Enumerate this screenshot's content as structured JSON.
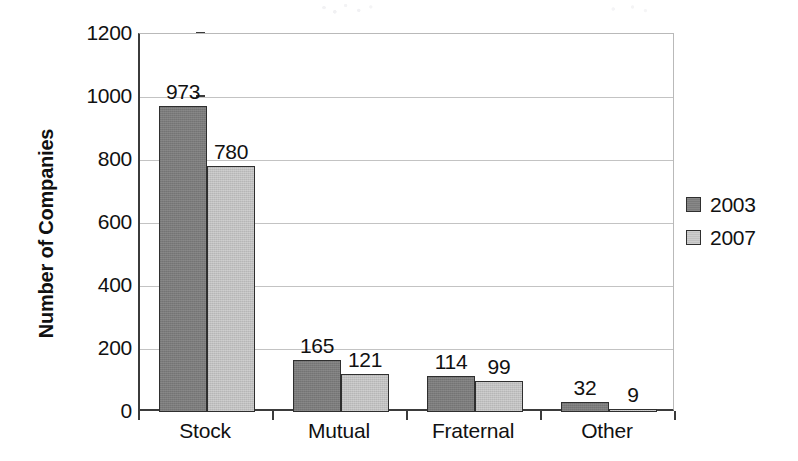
{
  "chart_data": {
    "type": "bar",
    "title": "",
    "xlabel": "",
    "ylabel": "Number of Companies",
    "categories": [
      "Stock",
      "Mutual",
      "Fraternal",
      "Other"
    ],
    "series": [
      {
        "name": "2003",
        "color": "#7b7b7b",
        "values": [
          973,
          165,
          114,
          32
        ]
      },
      {
        "name": "2007",
        "color": "#c0c0c0",
        "values": [
          780,
          121,
          99,
          9
        ]
      }
    ],
    "ylim": [
      0,
      1200
    ],
    "ytick_labels": [
      "0",
      "200",
      "400",
      "600",
      "800",
      "1000",
      "1200"
    ],
    "ytick_values": [
      0,
      200,
      400,
      600,
      800,
      1000,
      1200
    ],
    "grid": "horizontal",
    "legend_position": "right",
    "data_labels": [
      "973",
      "780",
      "165",
      "121",
      "114",
      "99",
      "32",
      "9"
    ]
  },
  "axes": {
    "y_title": "Number of Companies",
    "y_ticks": [
      {
        "label": "1200",
        "value": 1200
      },
      {
        "label": "1000",
        "value": 1000
      },
      {
        "label": "800",
        "value": 800
      },
      {
        "label": "600",
        "value": 600
      },
      {
        "label": "400",
        "value": 400
      },
      {
        "label": "200",
        "value": 200
      },
      {
        "label": "0",
        "value": 0
      }
    ],
    "x_categories": [
      {
        "label": "Stock"
      },
      {
        "label": "Mutual"
      },
      {
        "label": "Fraternal"
      },
      {
        "label": "Other"
      }
    ]
  },
  "legend": {
    "entries": [
      {
        "label": "2003",
        "color": "#7b7b7b"
      },
      {
        "label": "2007",
        "color": "#c0c0c0"
      }
    ]
  },
  "bars": [
    {
      "group": "Stock",
      "series": "2003",
      "value": 973,
      "label": "973"
    },
    {
      "group": "Stock",
      "series": "2007",
      "value": 780,
      "label": "780"
    },
    {
      "group": "Mutual",
      "series": "2003",
      "value": 165,
      "label": "165"
    },
    {
      "group": "Mutual",
      "series": "2007",
      "value": 121,
      "label": "121"
    },
    {
      "group": "Fraternal",
      "series": "2003",
      "value": 114,
      "label": "114"
    },
    {
      "group": "Fraternal",
      "series": "2007",
      "value": 99,
      "label": "99"
    },
    {
      "group": "Other",
      "series": "2003",
      "value": 32,
      "label": "32"
    },
    {
      "group": "Other",
      "series": "2007",
      "value": 9,
      "label": "9"
    }
  ]
}
